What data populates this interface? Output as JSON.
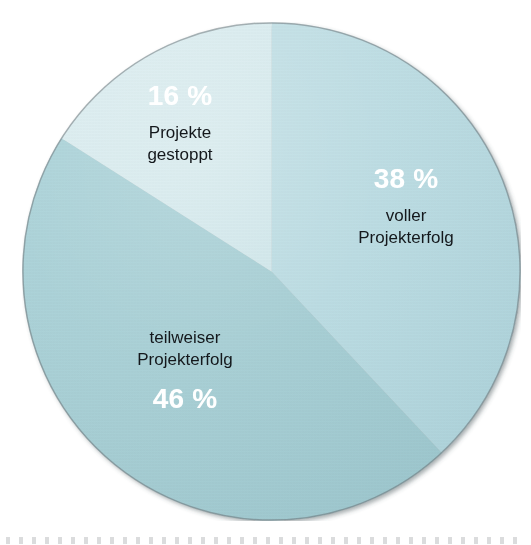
{
  "chart_data": {
    "type": "pie",
    "title": "",
    "subtitle": "",
    "xlabel": "",
    "ylabel": "",
    "legend_position": "none",
    "grid": false,
    "units": "percent",
    "total": 100,
    "start_angle_deg": 0,
    "direction": "clockwise",
    "categories": [
      "voller Projekterfolg",
      "teilweiser Projekterfolg",
      "Projekte gestoppt"
    ],
    "values": [
      38,
      46,
      16
    ],
    "value_labels": [
      "38 %",
      "46 %",
      "16 %"
    ],
    "colors": [
      "#b8dae1",
      "#a4cdd3",
      "#d8ebee"
    ],
    "slices": [
      {
        "name": "voller Projekterfolg",
        "value": 38,
        "pct_label": "38 %",
        "label_line1": "voller",
        "label_line2": "Projekterfolg",
        "color": "#b8dae1",
        "start_angle_deg": 0,
        "end_angle_deg": 136.8
      },
      {
        "name": "teilweiser Projekterfolg",
        "value": 46,
        "pct_label": "46 %",
        "label_line1": "teilweiser",
        "label_line2": "Projekterfolg",
        "color": "#a4cdd3",
        "start_angle_deg": 136.8,
        "end_angle_deg": 302.4
      },
      {
        "name": "Projekte gestoppt",
        "value": 16,
        "pct_label": "16 %",
        "label_line1": "Projekte",
        "label_line2": "gestoppt",
        "color": "#d8ebee",
        "start_angle_deg": 302.4,
        "end_angle_deg": 360
      }
    ]
  },
  "style": {
    "pct_text_color": "#ffffff",
    "category_text_color": "#14181c",
    "outline_color": "#6f7b80",
    "background": "#ffffff"
  }
}
